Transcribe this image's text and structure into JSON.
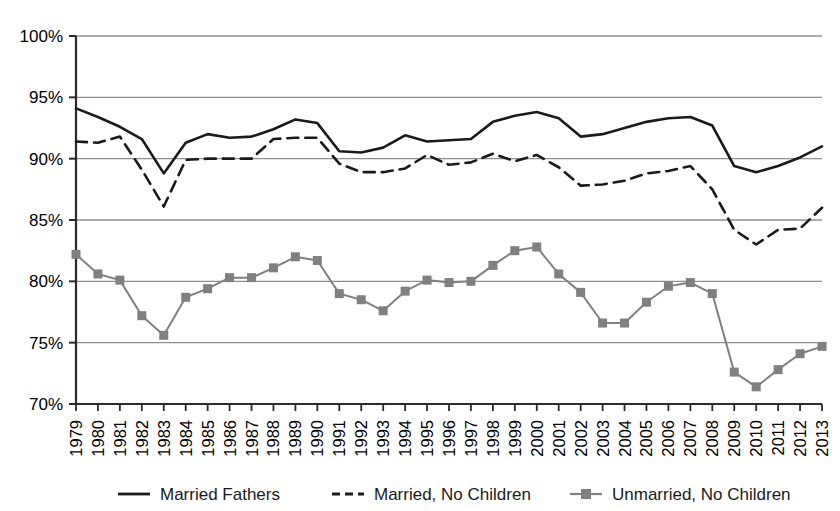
{
  "chart_data": {
    "type": "line",
    "title": "",
    "subtitle": "",
    "xlabel": "",
    "ylabel": "",
    "grid": true,
    "legend_position": "bottom",
    "xlim": [
      1979,
      2013
    ],
    "ylim": [
      70,
      100
    ],
    "ytick_step": 5,
    "ytick_labels": [
      "100%",
      "95%",
      "90%",
      "85%",
      "80%",
      "75%",
      "70%"
    ],
    "ytick_values": [
      100,
      95,
      90,
      85,
      80,
      75,
      70
    ],
    "categories": [
      "1979",
      "1980",
      "1981",
      "1982",
      "1983",
      "1984",
      "1985",
      "1986",
      "1987",
      "1988",
      "1989",
      "1990",
      "1991",
      "1992",
      "1993",
      "1994",
      "1995",
      "1996",
      "1997",
      "1998",
      "1999",
      "2000",
      "2001",
      "2002",
      "2003",
      "2004",
      "2005",
      "2006",
      "2007",
      "2008",
      "2009",
      "2010",
      "2011",
      "2012",
      "2013"
    ],
    "series": [
      {
        "name": "Married Fathers",
        "style": "solid",
        "marker": "none",
        "color": "#1a1a1a",
        "values": [
          94.1,
          93.4,
          92.6,
          91.6,
          88.8,
          91.3,
          92.0,
          91.7,
          91.8,
          92.4,
          93.2,
          92.9,
          90.6,
          90.5,
          90.9,
          91.9,
          91.4,
          91.5,
          91.6,
          93.0,
          93.5,
          93.8,
          93.3,
          91.8,
          92.0,
          92.5,
          93.0,
          93.3,
          93.4,
          92.7,
          89.4,
          88.9,
          89.4,
          90.1,
          91.0
        ]
      },
      {
        "name": "Married, No Children",
        "style": "dashed",
        "marker": "none",
        "color": "#1a1a1a",
        "values": [
          91.4,
          91.3,
          91.8,
          89.1,
          86.1,
          89.9,
          90.0,
          90.0,
          90.0,
          91.6,
          91.7,
          91.7,
          89.6,
          88.9,
          88.9,
          89.2,
          90.3,
          89.5,
          89.7,
          90.4,
          89.8,
          90.3,
          89.3,
          87.8,
          87.9,
          88.2,
          88.8,
          89.0,
          89.4,
          87.5,
          84.2,
          83.0,
          84.2,
          84.3,
          86.0
        ]
      },
      {
        "name": "Unmarried, No Children",
        "style": "solid",
        "marker": "square",
        "color": "#808080",
        "values": [
          82.2,
          80.6,
          80.1,
          77.2,
          75.6,
          78.7,
          79.4,
          80.3,
          80.3,
          81.1,
          82.0,
          81.7,
          79.0,
          78.5,
          77.6,
          79.2,
          80.1,
          79.9,
          80.0,
          81.3,
          82.5,
          82.8,
          80.6,
          79.1,
          76.6,
          76.6,
          78.3,
          79.6,
          79.9,
          79.0,
          72.6,
          71.4,
          72.8,
          74.1,
          74.7
        ]
      }
    ],
    "legend": [
      {
        "label": "Married Fathers",
        "style": "solid",
        "marker": "none",
        "color": "#1a1a1a"
      },
      {
        "label": "Married, No Children",
        "style": "dashed",
        "marker": "none",
        "color": "#1a1a1a"
      },
      {
        "label": "Unmarried, No Children",
        "style": "solid",
        "marker": "square",
        "color": "#808080"
      }
    ]
  },
  "colors": {
    "axis": "#2b2b2b",
    "grid": "#909090",
    "plot_background": "#ffffff",
    "series_dark": "#1a1a1a",
    "series_gray": "#808080"
  }
}
